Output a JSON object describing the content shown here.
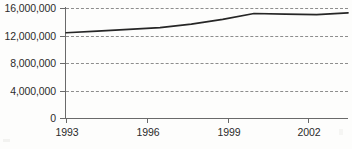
{
  "chart_data": {
    "type": "line",
    "title": "",
    "subtitle": "",
    "xlabel": "",
    "ylabel": "",
    "x": [
      1993,
      1994,
      1995,
      1996,
      1997,
      1998,
      1999,
      2000,
      2001,
      2002
    ],
    "series": [
      {
        "name": "value",
        "values": [
          12400000,
          12650000,
          12900000,
          13150000,
          13650000,
          14350000,
          15200000,
          15100000,
          15050000,
          15300000
        ]
      }
    ],
    "xlim": [
      1993,
      2002
    ],
    "ylim": [
      0,
      16000000
    ],
    "y_ticks": [
      0,
      4000000,
      8000000,
      12000000,
      16000000
    ],
    "y_tick_labels": [
      "0",
      "4,000,000",
      "8,000,000",
      "12,000,000",
      "16,000,000"
    ],
    "x_ticks": [
      1993,
      1996,
      1999,
      2002
    ],
    "x_tick_labels": [
      "1993",
      "1996",
      "1999",
      "2002"
    ],
    "grid": "horizontal-dashed",
    "legend": "none",
    "annotations": [
      {
        "name": "growth-callout",
        "text": "+19%",
        "x": 2002,
        "y": 15300000
      }
    ],
    "colors": {
      "line": "#262626",
      "grid": "#8d8d8d",
      "axis": "#6a6a6a",
      "text": "#2b2b2b",
      "background": "#fdfdfc"
    }
  }
}
